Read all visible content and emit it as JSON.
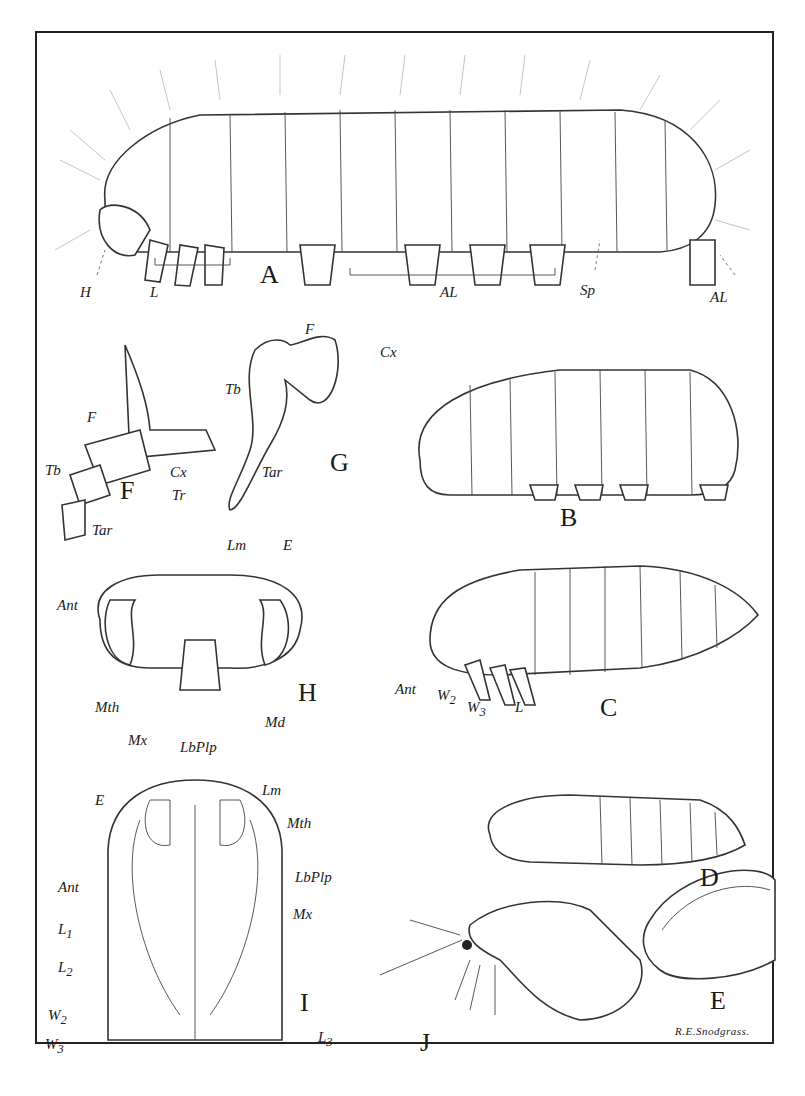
{
  "plate": {
    "signature": "R.E.Snodgrass.",
    "figures": [
      {
        "id": "A",
        "label": "A",
        "labels": [
          "H",
          "L",
          "AL",
          "Sp",
          "AL"
        ]
      },
      {
        "id": "B",
        "label": "B",
        "labels": []
      },
      {
        "id": "C",
        "label": "C",
        "labels": [
          "Ant",
          "W2",
          "W3",
          "L"
        ]
      },
      {
        "id": "D",
        "label": "D",
        "labels": []
      },
      {
        "id": "E",
        "label": "E",
        "labels": []
      },
      {
        "id": "F",
        "label": "F",
        "labels": [
          "F",
          "Tb",
          "Tr",
          "Cx",
          "Tar"
        ]
      },
      {
        "id": "G",
        "label": "G",
        "labels": [
          "F",
          "Cx",
          "Tb",
          "Tar"
        ]
      },
      {
        "id": "H",
        "label": "H",
        "labels": [
          "Lm",
          "E",
          "Ant",
          "Mth",
          "Md",
          "Mx",
          "LbPlp"
        ]
      },
      {
        "id": "I",
        "label": "I",
        "labels": [
          "E",
          "Lm",
          "Mth",
          "LbPlp",
          "Ant",
          "Mx",
          "L1",
          "L2",
          "W2",
          "W3",
          "L3"
        ]
      },
      {
        "id": "J",
        "label": "J",
        "labels": []
      }
    ]
  },
  "labels": {
    "A": {
      "H": "H",
      "L": "L",
      "AL1": "AL",
      "Sp": "Sp",
      "AL2": "AL"
    },
    "F": {
      "F": "F",
      "Tb": "Tb",
      "Tr": "Tr",
      "Cx": "Cx",
      "Tar": "Tar"
    },
    "G": {
      "F": "F",
      "Cx": "Cx",
      "Tb": "Tb",
      "Tar": "Tar"
    },
    "H": {
      "Lm": "Lm",
      "E": "E",
      "Ant": "Ant",
      "Mth": "Mth",
      "Md": "Md",
      "Mx": "Mx",
      "LbPlp": "LbPlp"
    },
    "C": {
      "Ant": "Ant",
      "W2": "W",
      "W2sub": "2",
      "W3": "W",
      "W3sub": "3",
      "L": "L"
    },
    "I": {
      "E": "E",
      "Lm": "Lm",
      "Mth": "Mth",
      "LbPlp": "LbPlp",
      "Ant": "Ant",
      "Mx": "Mx",
      "L1": "L",
      "L1sub": "1",
      "L2": "L",
      "L2sub": "2",
      "W2": "W",
      "W2sub": "2",
      "W3": "W",
      "W3sub": "3",
      "L3": "L",
      "L3sub": "3"
    }
  }
}
